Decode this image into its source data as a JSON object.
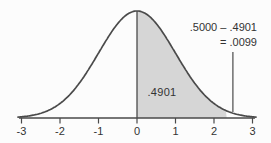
{
  "chart_data": {
    "type": "area",
    "subtype": "normal-distribution-curve",
    "title": "",
    "mean": 0,
    "sd": 1,
    "xlim": [
      -3.09,
      3.09
    ],
    "x_tick_values": [
      -3,
      -2,
      -1,
      0,
      1,
      2,
      3
    ],
    "x_tick_labels": [
      "-3",
      "-2",
      "-1",
      "0",
      "1",
      "2",
      "3"
    ],
    "shaded_region": {
      "from": 0,
      "to": 2.33,
      "area_value": 0.4901,
      "area_label": ".4901"
    },
    "tail_region": {
      "from": 2.33,
      "value": 0.0099
    },
    "annotation": {
      "line1": ".5000 – .4901",
      "line2": "= .0099",
      "pointer_z": 2.49
    },
    "colors": {
      "background": "#fcfcfc",
      "area_fill": "#d6d6d6",
      "curve_stroke": "#4a4a4a",
      "text": "#333333"
    },
    "legend": null,
    "grid": false
  }
}
